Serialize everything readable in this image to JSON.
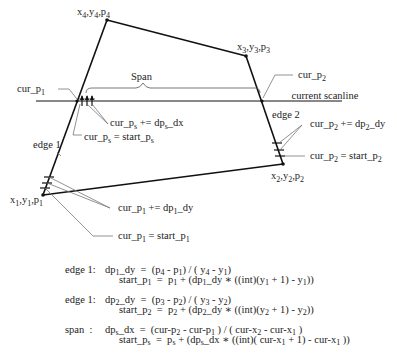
{
  "diagram": {
    "vertices": [
      {
        "id": "p1",
        "label_x": "x",
        "label_y": "y",
        "label_p": "p",
        "index": "1"
      },
      {
        "id": "p2",
        "label_x": "x",
        "label_y": "y",
        "label_p": "p",
        "index": "2"
      },
      {
        "id": "p3",
        "label_x": "x",
        "label_y": "y",
        "label_p": "p",
        "index": "3"
      },
      {
        "id": "p4",
        "label_x": "x",
        "label_y": "y",
        "label_p": "p",
        "index": "4"
      }
    ],
    "labels": {
      "span": "Span",
      "current_scanline": "current scanline",
      "edge1": "edge 1",
      "edge2": "edge 2",
      "cur_p1": "cur_p",
      "cur_p1_sub": "1",
      "cur_p2": "cur_p",
      "cur_p2_sub": "2",
      "cur_ps_inc": "cur_p",
      "cur_ps_inc_sub": "s",
      "cur_ps_inc_rhs": " += dp",
      "cur_ps_inc_rhs_sub": "s",
      "cur_ps_inc_tail": "_dx",
      "cur_ps_start": "cur_p",
      "cur_ps_start_sub": "s",
      "cur_ps_start_rhs": " = start_p",
      "cur_ps_start_rhs_sub": "s",
      "cur_p2_inc": "cur_p",
      "cur_p2_inc_sub": "2",
      "cur_p2_inc_rhs": " += dp",
      "cur_p2_inc_rhs_sub": "2",
      "cur_p2_inc_tail": "_dy",
      "cur_p2_start": "cur_p",
      "cur_p2_start_sub": "2",
      "cur_p2_start_rhs": " = start_p",
      "cur_p2_start_rhs_sub": "2",
      "cur_p1_inc": "cur_p",
      "cur_p1_inc_sub": "1",
      "cur_p1_inc_rhs": " += dp",
      "cur_p1_inc_rhs_sub": "1",
      "cur_p1_inc_tail": "_dy",
      "cur_p1_start": "cur_p",
      "cur_p1_start_sub": "1",
      "cur_p1_start_rhs": " = start_p",
      "cur_p1_start_rhs_sub": "1"
    }
  },
  "equations": [
    {
      "name": "edge 1:",
      "line1": "dp1_dy = (p4 - p1) / ( y4 - y1)",
      "line2": "start_p1 = p1 + (dp1_dy * ((int)(y1 + 1) - y1))"
    },
    {
      "name": "edge 1:",
      "line1": "dp2_dy = (p3 - p2) / ( y3 - y2)",
      "line2": "start_p2 = p2 + (dp2_dy * ((int)(y2 + 1) - y2))"
    },
    {
      "name": "span  :",
      "line1": "dps_dx = (cur-p2 - cur-p1 ) / ( cur-x2 - cur-x1 )",
      "line2": "start_ps = ps + (dps_dx * ((int)( cur-x1 + 1) - cur-x1 ))"
    }
  ]
}
